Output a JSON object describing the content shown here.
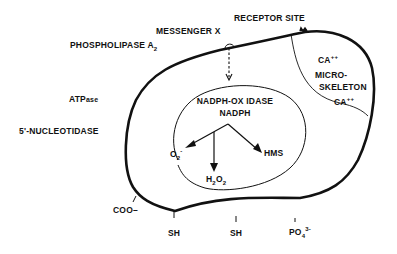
{
  "diagram": {
    "outer_labels": {
      "messenger": "MESSENGER X",
      "receptor": "RECEPTOR SITE",
      "phospholipase": "PHOSPHOLIPASE A",
      "phospholipase_sub": "2",
      "atpase_main": "ATP",
      "atpase_suffix": "ase",
      "nucleotidase": "5'-NUCLEOTIDASE"
    },
    "microskeleton": {
      "ca_top": "CA",
      "ca_top_sup": "++",
      "line1": "MICRO-",
      "line2": "SKELETON",
      "ca_bottom": "CA",
      "ca_bottom_sup": "++"
    },
    "inner_compartment": {
      "title": "NADPH-OX IDASE",
      "substrate": "NADPH",
      "products": {
        "superoxide": "O",
        "superoxide_sub": "2",
        "superoxide_sup": "-",
        "peroxide_h": "H",
        "peroxide_sub1": "2",
        "peroxide_o": "O",
        "peroxide_sub2": "2",
        "hms": "HMS"
      }
    },
    "surface_groups": {
      "carboxyl": "COO–",
      "sh_left": "SH",
      "sh_right": "SH",
      "phosphate": "PO",
      "phosphate_sub": "4",
      "phosphate_sup": "3-"
    },
    "colors": {
      "line": "#111111",
      "background": "#ffffff"
    }
  }
}
